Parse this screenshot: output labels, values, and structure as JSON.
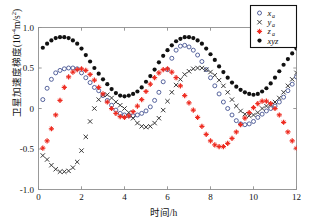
{
  "chart_data": {
    "type": "scatter",
    "title": "",
    "xlabel": "时间/h",
    "ylabel": "卫星加速度梯度(10⁻⁴m/s²)",
    "xlim": [
      0,
      12
    ],
    "ylim": [
      -1.0,
      1.0
    ],
    "xticks": [
      0,
      2,
      4,
      6,
      8,
      10,
      12
    ],
    "xticklabels": [
      "0",
      "2",
      "4",
      "6",
      "8",
      "10",
      "12"
    ],
    "yticks": [
      -1.0,
      -0.5,
      0,
      0.5,
      1.0
    ],
    "yticklabels": [
      "-1.0",
      "-0.5",
      "0",
      "0.5",
      "1.0"
    ],
    "grid": false,
    "legend_position": "upper right",
    "series": [
      {
        "name": "x_a",
        "label_base": "x",
        "label_sub": "a",
        "marker": "open-circle",
        "color": "#3b4a8c",
        "x": [
          0.2,
          0.4,
          0.6,
          0.8,
          1.0,
          1.2,
          1.4,
          1.6,
          1.8,
          2.0,
          2.2,
          2.4,
          2.6,
          2.8,
          3.0,
          3.2,
          3.4,
          3.6,
          3.8,
          4.0,
          4.2,
          4.4,
          4.6,
          4.8,
          5.0,
          5.2,
          5.4,
          5.6,
          5.8,
          6.0,
          6.2,
          6.4,
          6.6,
          6.8,
          7.0,
          7.2,
          7.4,
          7.6,
          7.8,
          8.0,
          8.2,
          8.4,
          8.6,
          8.8,
          9.0,
          9.2,
          9.4,
          9.6,
          9.8,
          10.0,
          10.2,
          10.4,
          10.6,
          10.8,
          11.0,
          11.2,
          11.4,
          11.6,
          11.8,
          12.0
        ],
        "y": [
          0.11,
          0.25,
          0.36,
          0.44,
          0.47,
          0.49,
          0.5,
          0.5,
          0.49,
          0.44,
          0.38,
          0.32,
          0.26,
          0.22,
          0.16,
          0.1,
          0.04,
          -0.02,
          -0.06,
          -0.08,
          -0.09,
          -0.09,
          -0.08,
          -0.06,
          -0.03,
          0.02,
          0.1,
          0.2,
          0.33,
          0.48,
          0.62,
          0.72,
          0.77,
          0.78,
          0.76,
          0.72,
          0.66,
          0.58,
          0.48,
          0.38,
          0.28,
          0.18,
          0.08,
          0.0,
          -0.08,
          -0.15,
          -0.19,
          -0.2,
          -0.19,
          -0.16,
          -0.11,
          -0.07,
          -0.03,
          0.0,
          0.03,
          0.08,
          0.14,
          0.22,
          0.3,
          0.39
        ]
      },
      {
        "name": "y_a",
        "label_base": "y",
        "label_sub": "a",
        "marker": "cross-x",
        "color": "#2d2d2d",
        "x": [
          0.2,
          0.4,
          0.6,
          0.8,
          1.0,
          1.2,
          1.4,
          1.6,
          1.8,
          2.0,
          2.2,
          2.4,
          2.6,
          2.8,
          3.0,
          3.2,
          3.4,
          3.6,
          3.8,
          4.0,
          4.2,
          4.4,
          4.6,
          4.8,
          5.0,
          5.2,
          5.4,
          5.6,
          5.8,
          6.0,
          6.2,
          6.4,
          6.6,
          6.8,
          7.0,
          7.2,
          7.4,
          7.6,
          7.8,
          8.0,
          8.2,
          8.4,
          8.6,
          8.8,
          9.0,
          9.2,
          9.4,
          9.6,
          9.8,
          10.0,
          10.2,
          10.4,
          10.6,
          10.8,
          11.0,
          11.2,
          11.4,
          11.6,
          11.8,
          12.0
        ],
        "y": [
          -0.58,
          -0.63,
          -0.7,
          -0.75,
          -0.78,
          -0.78,
          -0.77,
          -0.73,
          -0.66,
          -0.52,
          -0.35,
          -0.16,
          0.0,
          0.11,
          0.17,
          0.17,
          0.13,
          0.08,
          0.04,
          0.0,
          -0.05,
          -0.12,
          -0.18,
          -0.22,
          -0.23,
          -0.22,
          -0.18,
          -0.12,
          -0.02,
          0.09,
          0.2,
          0.29,
          0.36,
          0.42,
          0.46,
          0.49,
          0.5,
          0.5,
          0.48,
          0.45,
          0.41,
          0.35,
          0.28,
          0.2,
          0.11,
          0.03,
          -0.03,
          -0.07,
          -0.09,
          -0.08,
          -0.05,
          0.0,
          0.03,
          0.05,
          0.08,
          0.13,
          0.2,
          0.28,
          0.36,
          0.44
        ]
      },
      {
        "name": "z_a",
        "label_base": "z",
        "label_sub": "a",
        "marker": "red-crosshair",
        "color": "#ee2b20",
        "x": [
          0.2,
          0.4,
          0.6,
          0.8,
          1.0,
          1.2,
          1.4,
          1.6,
          1.8,
          2.0,
          2.2,
          2.4,
          2.6,
          2.8,
          3.0,
          3.2,
          3.4,
          3.6,
          3.8,
          4.0,
          4.2,
          4.4,
          4.6,
          4.8,
          5.0,
          5.2,
          5.4,
          5.6,
          5.8,
          6.0,
          6.2,
          6.4,
          6.6,
          6.8,
          7.0,
          7.2,
          7.4,
          7.6,
          7.8,
          8.0,
          8.2,
          8.4,
          8.6,
          8.8,
          9.0,
          9.2,
          9.4,
          9.6,
          9.8,
          10.0,
          10.2,
          10.4,
          10.6,
          10.8,
          11.0,
          11.2,
          11.4,
          11.6,
          11.8,
          12.0
        ],
        "y": [
          -0.49,
          -0.4,
          -0.25,
          -0.08,
          0.1,
          0.26,
          0.39,
          0.45,
          0.48,
          0.49,
          0.47,
          0.42,
          0.35,
          0.26,
          0.18,
          0.08,
          0.0,
          -0.06,
          -0.1,
          -0.11,
          -0.09,
          -0.04,
          0.03,
          0.11,
          0.21,
          0.3,
          0.38,
          0.44,
          0.48,
          0.49,
          0.45,
          0.38,
          0.28,
          0.16,
          0.07,
          -0.02,
          -0.11,
          -0.22,
          -0.32,
          -0.4,
          -0.45,
          -0.47,
          -0.47,
          -0.43,
          -0.37,
          -0.29,
          -0.2,
          -0.12,
          -0.05,
          0.01,
          0.06,
          0.09,
          0.09,
          0.06,
          0.0,
          -0.08,
          -0.17,
          -0.29,
          -0.4,
          -0.49
        ]
      },
      {
        "name": "xyz",
        "label_base": "xyz",
        "label_sub": "",
        "marker": "filled-circle",
        "color": "#111111",
        "x": [
          0.2,
          0.4,
          0.6,
          0.8,
          1.0,
          1.2,
          1.4,
          1.6,
          1.8,
          2.0,
          2.2,
          2.4,
          2.6,
          2.8,
          3.0,
          3.2,
          3.4,
          3.6,
          3.8,
          4.0,
          4.2,
          4.4,
          4.6,
          4.8,
          5.0,
          5.2,
          5.4,
          5.6,
          5.8,
          6.0,
          6.2,
          6.4,
          6.6,
          6.8,
          7.0,
          7.2,
          7.4,
          7.6,
          7.8,
          8.0,
          8.2,
          8.4,
          8.6,
          8.8,
          9.0,
          9.2,
          9.4,
          9.6,
          9.8,
          10.0,
          10.2,
          10.4,
          10.6,
          10.8,
          11.0,
          11.2,
          11.4,
          11.6,
          11.8,
          12.0
        ],
        "y": [
          0.75,
          0.8,
          0.84,
          0.87,
          0.88,
          0.88,
          0.87,
          0.84,
          0.8,
          0.74,
          0.66,
          0.58,
          0.5,
          0.43,
          0.36,
          0.3,
          0.24,
          0.19,
          0.16,
          0.15,
          0.16,
          0.18,
          0.21,
          0.26,
          0.33,
          0.4,
          0.48,
          0.57,
          0.65,
          0.72,
          0.78,
          0.83,
          0.86,
          0.88,
          0.88,
          0.87,
          0.84,
          0.8,
          0.74,
          0.67,
          0.6,
          0.52,
          0.45,
          0.38,
          0.32,
          0.27,
          0.23,
          0.2,
          0.18,
          0.17,
          0.18,
          0.21,
          0.25,
          0.31,
          0.38,
          0.46,
          0.54,
          0.61,
          0.68,
          0.74
        ]
      }
    ]
  },
  "legend": {
    "entries": [
      {
        "label": "x",
        "sub": "a",
        "marker": "open-circle"
      },
      {
        "label": "y",
        "sub": "a",
        "marker": "cross-x"
      },
      {
        "label": "z",
        "sub": "a",
        "marker": "red-crosshair"
      },
      {
        "label": "xyz",
        "sub": "",
        "marker": "filled-circle"
      }
    ]
  },
  "axes": {
    "x_axis_label": "时间/h",
    "y_axis_label": "卫星加速度梯度(10",
    "y_axis_label_sup": "-4",
    "y_axis_label_tail": "m/s",
    "y_axis_label_sup2": "2",
    "y_axis_label_end": ")"
  }
}
